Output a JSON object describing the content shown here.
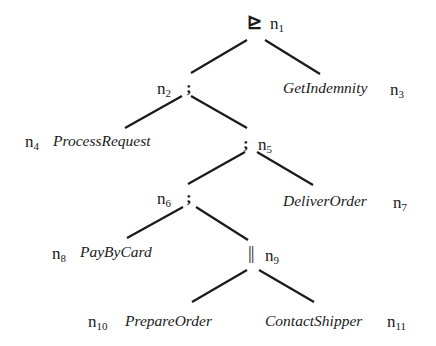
{
  "diagram": {
    "type": "process-tree",
    "nodes": [
      {
        "id": "n1",
        "prefix": "n",
        "index": "1",
        "kind": "operator",
        "label": "⊵"
      },
      {
        "id": "n2",
        "prefix": "n",
        "index": "2",
        "kind": "operator",
        "label": ";"
      },
      {
        "id": "n3",
        "prefix": "n",
        "index": "3",
        "kind": "activity",
        "label": "GetIndemnity"
      },
      {
        "id": "n4",
        "prefix": "n",
        "index": "4",
        "kind": "activity",
        "label": "ProcessRequest"
      },
      {
        "id": "n5",
        "prefix": "n",
        "index": "5",
        "kind": "operator",
        "label": ";"
      },
      {
        "id": "n6",
        "prefix": "n",
        "index": "6",
        "kind": "operator",
        "label": ";"
      },
      {
        "id": "n7",
        "prefix": "n",
        "index": "7",
        "kind": "activity",
        "label": "DeliverOrder"
      },
      {
        "id": "n8",
        "prefix": "n",
        "index": "8",
        "kind": "activity",
        "label": "PayByCard"
      },
      {
        "id": "n9",
        "prefix": "n",
        "index": "9",
        "kind": "operator",
        "label": "||"
      },
      {
        "id": "n10",
        "prefix": "n",
        "index": "10",
        "kind": "activity",
        "label": "PrepareOrder"
      },
      {
        "id": "n11",
        "prefix": "n",
        "index": "11",
        "kind": "activity",
        "label": "ContactShipper"
      }
    ],
    "edges": [
      {
        "from": "n1",
        "to": "n2"
      },
      {
        "from": "n1",
        "to": "n3"
      },
      {
        "from": "n2",
        "to": "n4"
      },
      {
        "from": "n2",
        "to": "n5"
      },
      {
        "from": "n5",
        "to": "n6"
      },
      {
        "from": "n5",
        "to": "n7"
      },
      {
        "from": "n6",
        "to": "n8"
      },
      {
        "from": "n6",
        "to": "n9"
      },
      {
        "from": "n9",
        "to": "n10"
      },
      {
        "from": "n9",
        "to": "n11"
      }
    ]
  }
}
